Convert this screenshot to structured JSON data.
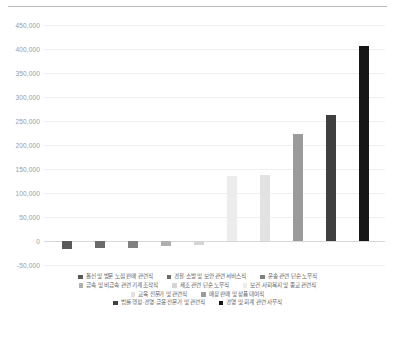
{
  "chart_data": {
    "type": "bar",
    "title": "",
    "subtitle": "",
    "xlabel": "",
    "ylabel": "",
    "ylim": [
      -50000,
      450000
    ],
    "ytick_labels": [
      "450,000",
      "400,000",
      "350,000",
      "300,000",
      "250,000",
      "200,000",
      "150,000",
      "100,000",
      "50,000",
      "0",
      "-50,000"
    ],
    "ytick_values": [
      450000,
      400000,
      350000,
      300000,
      250000,
      200000,
      150000,
      100000,
      50000,
      0,
      -50000
    ],
    "grid": true,
    "legend_position": "bottom",
    "categories": [
      "통신 및 방문 노점 판매 관련직",
      "경찰·소방 및 보안 관련 서비스직",
      "운송 관련 단순 노무직",
      "금속 및 비금속 관련 기계 조작직",
      "제조 관련 단순 노무직",
      "보건·사회복지 및 종교 관련직",
      "교육 전문가 및 관련직",
      "매장 판매 및 상품 대여직",
      "법률·행정·경영·금융 전문가 및 관련직",
      "경영 및 회계 관련 사무직"
    ],
    "values": [
      -16000,
      -15000,
      -14000,
      -10000,
      -8000,
      136000,
      137000,
      222000,
      263000,
      406000
    ],
    "colors": [
      "#595959",
      "#6b6b6b",
      "#808080",
      "#b0b0b0",
      "#d4d4d4",
      "#ececec",
      "#e2e2e2",
      "#9b9b9b",
      "#3f3f3f",
      "#161616"
    ]
  },
  "legend": {
    "rows": [
      [
        {
          "label": "통신 및 방문 노점 판매 관련직",
          "color": "#595959"
        },
        {
          "label": "경찰·소방 및 보안 관련 서비스직",
          "color": "#6b6b6b"
        },
        {
          "label": "운송 관련 단순 노무직",
          "color": "#808080"
        }
      ],
      [
        {
          "label": "금속 및 비금속 관련 기계 조작직",
          "color": "#b0b0b0"
        },
        {
          "label": "제조 관련 단순 노무직",
          "color": "#d4d4d4"
        },
        {
          "label": "보건·사회복지 및 종교 관련직",
          "color": "#ececec"
        }
      ],
      [
        {
          "label": "교육 전문가 및 관련직",
          "color": "#e2e2e2"
        },
        {
          "label": "매장 판매 및 상품 대여직",
          "color": "#9b9b9b"
        }
      ],
      [
        {
          "label": "법률·행정·경영·금융 전문가 및 관련직",
          "color": "#3f3f3f"
        },
        {
          "label": "경영 및 회계 관련 사무직",
          "color": "#161616"
        }
      ]
    ]
  },
  "style": {
    "background": "#ffffff",
    "gridline_color": "#eeeff1",
    "zero_line_color": "#d5d7da",
    "axis_text_color": "#9a9da1",
    "legend_text_color": "#5f6266",
    "top_rule_color": "#b9bcc0"
  }
}
